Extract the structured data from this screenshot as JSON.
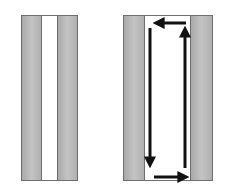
{
  "diagram": {
    "panels": [
      {
        "name": "channel-static",
        "left": 21,
        "width": 57,
        "strips": [
          {
            "type": "wall",
            "width": 20
          },
          {
            "type": "channel",
            "width": 17
          },
          {
            "type": "wall",
            "width": 20
          }
        ]
      },
      {
        "name": "channel-with-flow",
        "left": 123,
        "width": 90,
        "strips": [
          {
            "type": "wall",
            "width": 20
          },
          {
            "type": "channel",
            "width": 49
          },
          {
            "type": "wall",
            "width": 21
          }
        ]
      }
    ],
    "arrows": [
      {
        "name": "arrow-left-top",
        "direction": "left",
        "x1": 186,
        "y1": 23,
        "x2": 155,
        "y2": 23
      },
      {
        "name": "arrow-down",
        "direction": "down",
        "x1": 150,
        "y1": 28,
        "x2": 150,
        "y2": 166
      },
      {
        "name": "arrow-right-bottom",
        "direction": "right",
        "x1": 154,
        "y1": 177,
        "x2": 187,
        "y2": 177
      },
      {
        "name": "arrow-up",
        "direction": "up",
        "x1": 185,
        "y1": 168,
        "x2": 185,
        "y2": 28
      }
    ],
    "colors": {
      "wall": "#b5b5b5",
      "channel": "#ffffff",
      "border": "#6e6e6e",
      "arrow": "#111111"
    }
  }
}
